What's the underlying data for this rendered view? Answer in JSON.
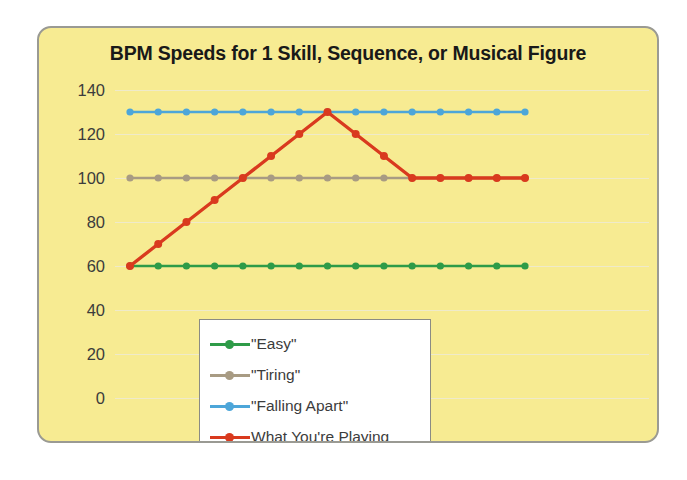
{
  "panel": {
    "background_color": "#f7eb92",
    "border_color": "#9a9a93"
  },
  "chart_data": {
    "type": "line",
    "title": "BPM Speeds for 1 Skill, Sequence, or Musical Figure",
    "xlabel": "",
    "ylabel": "",
    "ylim": [
      0,
      140
    ],
    "yticks": [
      140,
      120,
      100,
      80,
      60,
      40,
      20,
      0
    ],
    "ytick_labels": [
      "140",
      "120",
      "100",
      "80",
      "60",
      "40",
      "20",
      "0"
    ],
    "grid": true,
    "legend_position": "lower-left-inside",
    "x": [
      1,
      2,
      3,
      4,
      5,
      6,
      7,
      8,
      9,
      10,
      11,
      12,
      13,
      14,
      15
    ],
    "series": [
      {
        "name": "\"Easy\"",
        "color": "#2e9b48",
        "values": [
          60,
          60,
          60,
          60,
          60,
          60,
          60,
          60,
          60,
          60,
          60,
          60,
          60,
          60,
          60
        ]
      },
      {
        "name": "\"Tiring\"",
        "color": "#a89b83",
        "values": [
          100,
          100,
          100,
          100,
          100,
          100,
          100,
          100,
          100,
          100,
          100,
          100,
          100,
          100,
          100
        ]
      },
      {
        "name": "\"Falling Apart\"",
        "color": "#4da6d9",
        "values": [
          130,
          130,
          130,
          130,
          130,
          130,
          130,
          130,
          130,
          130,
          130,
          130,
          130,
          130,
          130
        ]
      },
      {
        "name": "What You're Playing",
        "color": "#d93a1e",
        "values": [
          60,
          70,
          80,
          90,
          100,
          110,
          120,
          130,
          120,
          110,
          100,
          100,
          100,
          100,
          100
        ]
      }
    ]
  },
  "legend": {
    "items": [
      {
        "label": "\"Easy\"",
        "color": "#2e9b48"
      },
      {
        "label": "\"Tiring\"",
        "color": "#a89b83"
      },
      {
        "label": "\"Falling Apart\"",
        "color": "#4da6d9"
      },
      {
        "label": "What You're Playing",
        "color": "#d93a1e"
      }
    ]
  }
}
